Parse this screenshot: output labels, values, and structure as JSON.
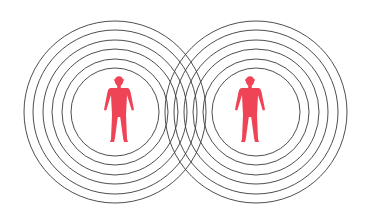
{
  "diagram": {
    "colors": {
      "background": "#ffffff",
      "ring_stroke": "#3a3a3a",
      "figure": "#ee4455"
    },
    "ring_groups": [
      {
        "name": "left",
        "cx": 115,
        "cy": 112,
        "radii": [
          44,
          53,
          63,
          72,
          82,
          91
        ]
      },
      {
        "name": "right",
        "cx": 256,
        "cy": 112,
        "radii": [
          44,
          53,
          63,
          72,
          82,
          91
        ]
      }
    ],
    "figures": [
      {
        "name": "left-person",
        "cx": 119
      },
      {
        "name": "right-person",
        "cx": 250
      }
    ]
  }
}
